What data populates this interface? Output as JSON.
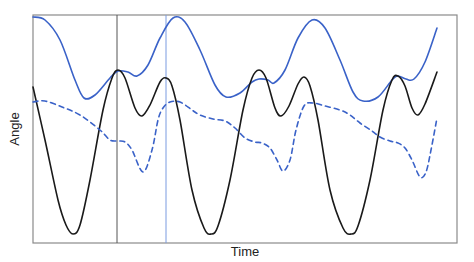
{
  "chart_data": {
    "type": "line",
    "title": "",
    "xlabel": "Time",
    "ylabel": "Angle",
    "grid": false,
    "legend": null,
    "ticks": {
      "x": [],
      "y": []
    },
    "frame": {
      "left": 33,
      "right": 457,
      "top": 15,
      "bottom": 243,
      "color": "#8a8a8a"
    },
    "vertical_markers": [
      {
        "name": "black-marker",
        "x": 117,
        "color": "#555555"
      },
      {
        "name": "blue-marker",
        "x": 166,
        "color": "#7a9be0"
      }
    ],
    "series": [
      {
        "name": "blue-solid",
        "style": "solid",
        "color": "#3a62c8",
        "points": [
          [
            33,
            17
          ],
          [
            45,
            20
          ],
          [
            60,
            40
          ],
          [
            75,
            80
          ],
          [
            84,
            98
          ],
          [
            95,
            95
          ],
          [
            110,
            78
          ],
          [
            118,
            71
          ],
          [
            128,
            72
          ],
          [
            137,
            76
          ],
          [
            148,
            65
          ],
          [
            160,
            38
          ],
          [
            173,
            18
          ],
          [
            185,
            22
          ],
          [
            200,
            50
          ],
          [
            215,
            85
          ],
          [
            226,
            97
          ],
          [
            240,
            93
          ],
          [
            252,
            82
          ],
          [
            259,
            79
          ],
          [
            268,
            80
          ],
          [
            274,
            83
          ],
          [
            285,
            70
          ],
          [
            298,
            38
          ],
          [
            312,
            20
          ],
          [
            325,
            28
          ],
          [
            340,
            60
          ],
          [
            353,
            92
          ],
          [
            363,
            101
          ],
          [
            378,
            97
          ],
          [
            392,
            80
          ],
          [
            398,
            76
          ],
          [
            406,
            79
          ],
          [
            414,
            79
          ],
          [
            425,
            62
          ],
          [
            437,
            28
          ]
        ]
      },
      {
        "name": "black-solid",
        "style": "solid",
        "color": "#1a1a1a",
        "points": [
          [
            33,
            87
          ],
          [
            45,
            140
          ],
          [
            58,
            200
          ],
          [
            66,
            225
          ],
          [
            73,
            234
          ],
          [
            80,
            225
          ],
          [
            90,
            180
          ],
          [
            103,
            110
          ],
          [
            112,
            78
          ],
          [
            118,
            70
          ],
          [
            125,
            78
          ],
          [
            135,
            108
          ],
          [
            142,
            116
          ],
          [
            150,
            105
          ],
          [
            160,
            82
          ],
          [
            166,
            78
          ],
          [
            172,
            86
          ],
          [
            180,
            120
          ],
          [
            192,
            190
          ],
          [
            204,
            228
          ],
          [
            211,
            234
          ],
          [
            218,
            226
          ],
          [
            230,
            180
          ],
          [
            243,
            110
          ],
          [
            252,
            78
          ],
          [
            259,
            70
          ],
          [
            266,
            78
          ],
          [
            275,
            108
          ],
          [
            281,
            116
          ],
          [
            289,
            106
          ],
          [
            298,
            84
          ],
          [
            304,
            77
          ],
          [
            310,
            86
          ],
          [
            318,
            120
          ],
          [
            330,
            190
          ],
          [
            343,
            228
          ],
          [
            351,
            234
          ],
          [
            358,
            226
          ],
          [
            370,
            180
          ],
          [
            383,
            110
          ],
          [
            392,
            80
          ],
          [
            398,
            76
          ],
          [
            405,
            86
          ],
          [
            412,
            108
          ],
          [
            418,
            115
          ],
          [
            425,
            104
          ],
          [
            437,
            72
          ]
        ]
      },
      {
        "name": "blue-dashed",
        "style": "dashed",
        "color": "#3a62c8",
        "points": [
          [
            33,
            102
          ],
          [
            45,
            101
          ],
          [
            62,
            107
          ],
          [
            80,
            115
          ],
          [
            100,
            130
          ],
          [
            110,
            140
          ],
          [
            118,
            141
          ],
          [
            125,
            142
          ],
          [
            132,
            150
          ],
          [
            143,
            172
          ],
          [
            152,
            150
          ],
          [
            158,
            120
          ],
          [
            163,
            108
          ],
          [
            170,
            102
          ],
          [
            180,
            102
          ],
          [
            192,
            110
          ],
          [
            200,
            115
          ],
          [
            213,
            119
          ],
          [
            225,
            121
          ],
          [
            235,
            128
          ],
          [
            245,
            138
          ],
          [
            255,
            142
          ],
          [
            262,
            143
          ],
          [
            270,
            148
          ],
          [
            277,
            160
          ],
          [
            283,
            171
          ],
          [
            290,
            160
          ],
          [
            296,
            130
          ],
          [
            304,
            106
          ],
          [
            313,
            103
          ],
          [
            325,
            106
          ],
          [
            340,
            110
          ],
          [
            350,
            115
          ],
          [
            360,
            123
          ],
          [
            372,
            131
          ],
          [
            380,
            137
          ],
          [
            390,
            141
          ],
          [
            398,
            143
          ],
          [
            405,
            148
          ],
          [
            412,
            160
          ],
          [
            420,
            177
          ],
          [
            426,
            172
          ],
          [
            431,
            150
          ],
          [
            437,
            118
          ]
        ]
      }
    ]
  }
}
